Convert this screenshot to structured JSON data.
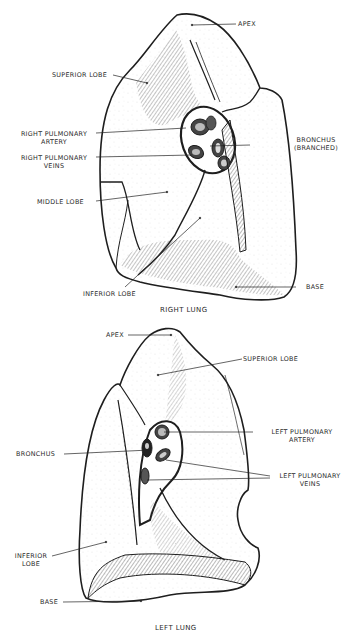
{
  "right_lung": {
    "title": "RIGHT LUNG",
    "labels": {
      "apex": "APEX",
      "superior_lobe": "SUPERIOR LOBE",
      "pulmonary_artery_1": "RIGHT PULMONARY",
      "pulmonary_artery_2": "ARTERY",
      "pulmonary_veins_1": "RIGHT PULMONARY",
      "pulmonary_veins_2": "VEINS",
      "bronchus_1": "BRONCHUS",
      "bronchus_2": "(BRANCHED)",
      "middle_lobe": "MIDDLE LOBE",
      "inferior_lobe": "INFERIOR LOBE",
      "base": "BASE"
    }
  },
  "left_lung": {
    "title": "LEFT LUNG",
    "labels": {
      "apex": "APEX",
      "superior_lobe": "SUPERIOR LOBE",
      "pulmonary_artery_1": "LEFT PULMONARY",
      "pulmonary_artery_2": "ARTERY",
      "bronchus": "BRONCHUS",
      "pulmonary_veins_1": "LEFT PULMONARY",
      "pulmonary_veins_2": "VEINS",
      "inferior_lobe_1": "INFERIOR",
      "inferior_lobe_2": "LOBE",
      "base": "BASE"
    }
  },
  "colors": {
    "ink": "#1e1e1e",
    "background": "#ffffff",
    "hatch": "#555555"
  }
}
